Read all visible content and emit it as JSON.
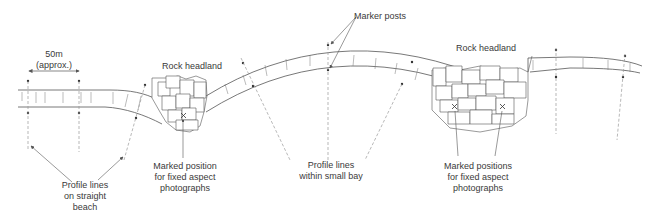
{
  "diagram": {
    "type": "coastal-monitoring-schematic",
    "colors": {
      "line": "#555555",
      "dashed": "#9a9a9a",
      "text": "#3a3a3a",
      "background": "#ffffff"
    },
    "labels": {
      "scale": {
        "line1": "50m",
        "line2": "(approx.)"
      },
      "headland_left": "Rock headland",
      "headland_right": "Rock headland",
      "marker_posts": "Marker posts",
      "profile_straight": {
        "line1": "Profile lines",
        "line2": "on straight",
        "line3": "beach"
      },
      "marked_position": {
        "line1": "Marked position",
        "line2": "for fixed aspect",
        "line3": "photographs"
      },
      "profile_bay": {
        "line1": "Profile lines",
        "line2": "within small bay"
      },
      "marked_positions": {
        "line1": "Marked positions",
        "line2": "for fixed aspect",
        "line3": "photographs"
      }
    },
    "icons": {
      "marker_post": "dot",
      "photo_position": "x-mark"
    }
  }
}
